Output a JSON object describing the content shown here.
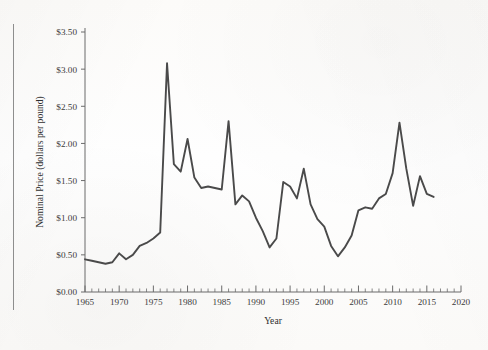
{
  "figure": {
    "background_color": "#fdfdfc",
    "line_color": "#4a4a4a",
    "axis_color": "#6b6b6b",
    "text_color": "#3b3b3b"
  },
  "chart_data": {
    "type": "line",
    "title": "",
    "xlabel": "Year",
    "ylabel": "Nominal Price (dollars per pound)",
    "xlim": [
      1965,
      2020
    ],
    "ylim": [
      0.0,
      3.5
    ],
    "grid": false,
    "legend": "none",
    "x_tick_labels": [
      "1965",
      "1970",
      "1975",
      "1980",
      "1985",
      "1990",
      "1995",
      "2000",
      "2005",
      "2010",
      "2015",
      "2020"
    ],
    "x_ticks": [
      1965,
      1970,
      1975,
      1980,
      1985,
      1990,
      1995,
      2000,
      2005,
      2010,
      2015,
      2020
    ],
    "x_minor_tick_step": 1,
    "y_tick_labels": [
      "$0.00",
      "$0.50",
      "$1.00",
      "$1.50",
      "$2.00",
      "$2.50",
      "$3.00",
      "$3.50"
    ],
    "y_ticks": [
      0.0,
      0.5,
      1.0,
      1.5,
      2.0,
      2.5,
      3.0,
      3.5
    ],
    "series": [
      {
        "name": "Nominal Price",
        "x": [
          1965,
          1966,
          1967,
          1968,
          1969,
          1970,
          1971,
          1972,
          1973,
          1974,
          1975,
          1976,
          1977,
          1978,
          1979,
          1980,
          1981,
          1982,
          1983,
          1984,
          1985,
          1986,
          1987,
          1988,
          1989,
          1990,
          1991,
          1992,
          1993,
          1994,
          1995,
          1996,
          1997,
          1998,
          1999,
          2000,
          2001,
          2002,
          2003,
          2004,
          2005,
          2006,
          2007,
          2008,
          2009,
          2010,
          2011,
          2012,
          2013,
          2014,
          2015,
          2016
        ],
        "values": [
          0.44,
          0.42,
          0.4,
          0.38,
          0.4,
          0.52,
          0.44,
          0.5,
          0.62,
          0.66,
          0.72,
          0.8,
          3.08,
          1.72,
          1.62,
          2.06,
          1.54,
          1.4,
          1.42,
          1.4,
          1.38,
          2.3,
          1.18,
          1.3,
          1.22,
          1.0,
          0.82,
          0.6,
          0.72,
          1.48,
          1.42,
          1.26,
          1.66,
          1.18,
          0.98,
          0.88,
          0.62,
          0.48,
          0.6,
          0.76,
          1.1,
          1.14,
          1.12,
          1.26,
          1.32,
          1.6,
          2.28,
          1.66,
          1.16,
          1.56,
          1.32,
          1.28
        ]
      }
    ],
    "annotations": []
  }
}
